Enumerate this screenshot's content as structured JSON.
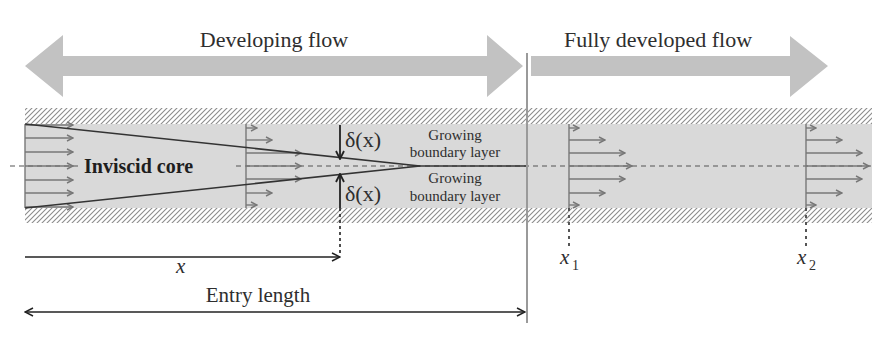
{
  "diagram": {
    "regions": {
      "developing_label": "Developing flow",
      "developed_label": "Fully developed flow"
    },
    "core_label": "Inviscid core",
    "boundary_layer": {
      "top": {
        "delta_label": "δ(x)",
        "line1": "Growing",
        "line2": "boundary layer"
      },
      "bottom": {
        "delta_label": "δ(x)",
        "line1": "Growing",
        "line2": "boundary layer"
      }
    },
    "dimensions": {
      "x_label": "x",
      "entry_length_label": "Entry length"
    },
    "stations": [
      {
        "var": "x",
        "subscript": "1"
      },
      {
        "var": "x",
        "subscript": "2"
      }
    ],
    "colors": {
      "region_arrow": "#c2c2c2",
      "channel_fill": "#d9d9d9",
      "wall_hatch": "#8c8c8c",
      "velocity_arrow": "#777777",
      "boundary_line": "#333333",
      "text": "#2e2e2e"
    }
  }
}
